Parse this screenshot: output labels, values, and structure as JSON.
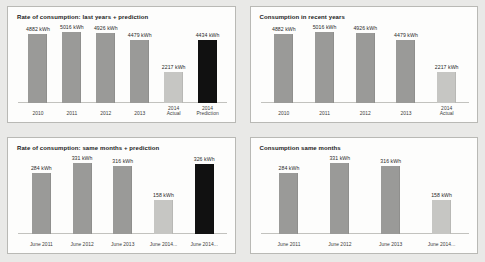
{
  "charts": [
    {
      "id": "rate-consumption-last-years",
      "title": "Rate of consumption: last years + prediction",
      "chart_data": {
        "type": "bar",
        "title": "Rate of consumption: last years + prediction",
        "xlabel": "",
        "ylabel": "",
        "ylim": [
          0,
          5016
        ],
        "grid": false,
        "legend": "none",
        "unit": "kWh",
        "categories": [
          "2010",
          "2011",
          "2012",
          "2013",
          "2014\nActual",
          "2014\nPrediction"
        ],
        "values": [
          4882,
          5016,
          4926,
          4479,
          2217,
          4434
        ],
        "value_labels": [
          "4882 kWh",
          "5016 kWh",
          "4926 kWh",
          "4479 kWh",
          "2217 kWh",
          "4434 kWh"
        ],
        "bar_styles": [
          "normal",
          "normal",
          "normal",
          "normal",
          "light",
          "dark"
        ],
        "colors": {
          "normal": "#9a9a98",
          "light": "#c6c6c3",
          "dark": "#111111"
        }
      }
    },
    {
      "id": "consumption-recent-years",
      "title": "Consumption in recent years",
      "chart_data": {
        "type": "bar",
        "title": "Consumption in recent years",
        "xlabel": "",
        "ylabel": "",
        "ylim": [
          0,
          5016
        ],
        "grid": false,
        "legend": "none",
        "unit": "kWh",
        "categories": [
          "2010",
          "2011",
          "2012",
          "2013",
          "2014\nActual"
        ],
        "values": [
          4882,
          5016,
          4926,
          4479,
          2217
        ],
        "value_labels": [
          "4882 kWh",
          "5016 kWh",
          "4926 kWh",
          "4479 kWh",
          "2217 kWh"
        ],
        "bar_styles": [
          "normal",
          "normal",
          "normal",
          "normal",
          "light"
        ],
        "colors": {
          "normal": "#9a9a98",
          "light": "#c6c6c3",
          "dark": "#111111"
        }
      }
    },
    {
      "id": "rate-consumption-same-months",
      "title": "Rate of consumption: same months + prediction",
      "chart_data": {
        "type": "bar",
        "title": "Rate of consumption: same months + prediction",
        "xlabel": "",
        "ylabel": "",
        "ylim": [
          0,
          331
        ],
        "grid": false,
        "legend": "none",
        "unit": "kWh",
        "categories": [
          "June 2011",
          "June 2012",
          "June 2013",
          "June 2014...",
          "June 2014..."
        ],
        "values": [
          284,
          331,
          316,
          158,
          326
        ],
        "value_labels": [
          "284 kWh",
          "331 kWh",
          "316 kWh",
          "158 kWh",
          "326 kWh"
        ],
        "bar_styles": [
          "normal",
          "normal",
          "normal",
          "light",
          "dark"
        ],
        "colors": {
          "normal": "#9a9a98",
          "light": "#c6c6c3",
          "dark": "#111111"
        }
      }
    },
    {
      "id": "consumption-same-months",
      "title": "Consumption same months",
      "chart_data": {
        "type": "bar",
        "title": "Consumption same months",
        "xlabel": "",
        "ylabel": "",
        "ylim": [
          0,
          331
        ],
        "grid": false,
        "legend": "none",
        "unit": "kWh",
        "categories": [
          "June 2011",
          "June 2012",
          "June 2013",
          "June 2014..."
        ],
        "values": [
          284,
          331,
          316,
          158
        ],
        "value_labels": [
          "284 kWh",
          "331 kWh",
          "316 kWh",
          "158 kWh"
        ],
        "bar_styles": [
          "normal",
          "normal",
          "normal",
          "light"
        ],
        "colors": {
          "normal": "#9a9a98",
          "light": "#c6c6c3",
          "dark": "#111111"
        }
      }
    }
  ]
}
